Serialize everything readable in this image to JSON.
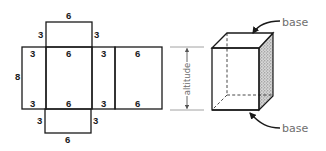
{
  "net": {
    "top_face": {
      "width_label": "6",
      "left_depth_label": "3",
      "right_depth_label": "3"
    },
    "left_face": {
      "height_label": "8",
      "top_label": "3",
      "bottom_label": "3"
    },
    "front_face": {
      "top_label": "6",
      "bottom_label": "6"
    },
    "right_face": {
      "top_label": "3",
      "bottom_label": "3"
    },
    "back_face": {
      "top_label": "6",
      "bottom_label": "6"
    },
    "bottom_face": {
      "width_label": "6",
      "left_depth_label": "3",
      "right_depth_label": "3"
    }
  },
  "prism": {
    "altitude_label": "altitude",
    "top_base_label": "base",
    "bottom_base_label": "base"
  },
  "colors": {
    "line": "#1a1a1a",
    "label_gray": "#6e6e6e",
    "shade": "#9a9a9a"
  }
}
